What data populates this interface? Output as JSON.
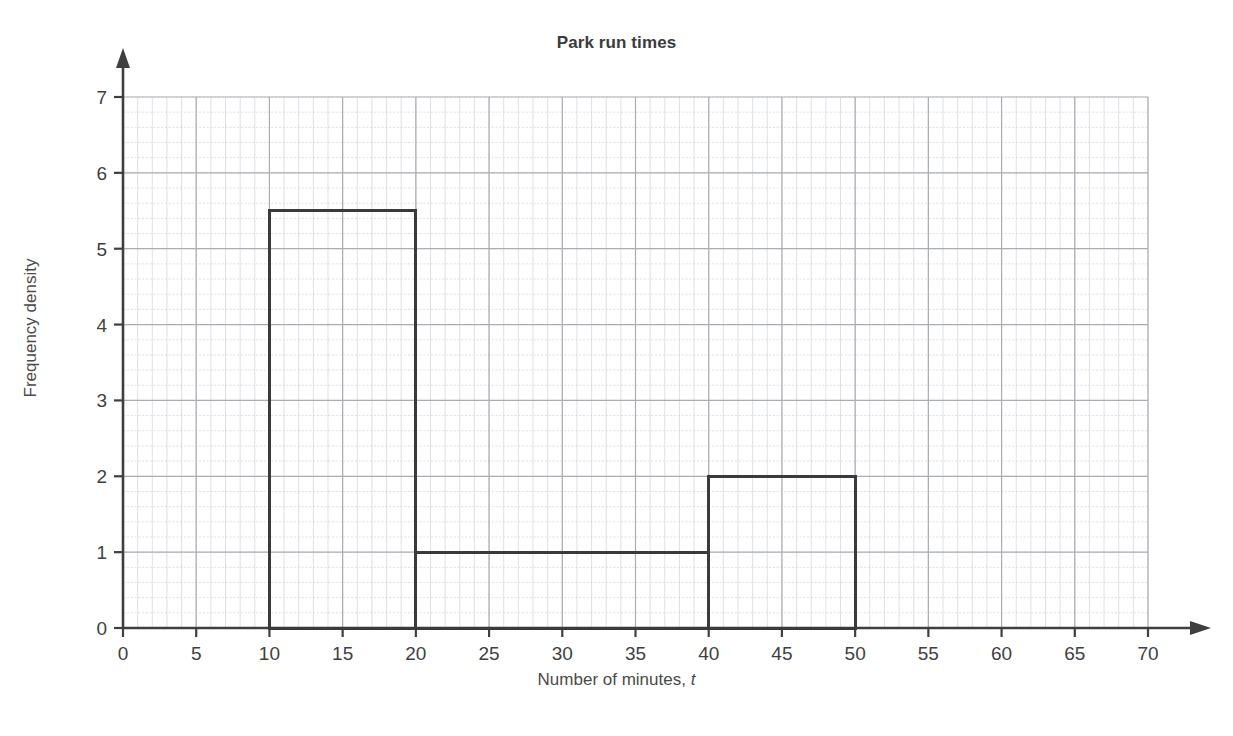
{
  "chart_data": {
    "type": "bar",
    "title": "Park run times",
    "xlabel_prefix": "Number of minutes, ",
    "xlabel_symbol": "t",
    "xlabel": "Number of minutes, t",
    "ylabel": "Frequency density",
    "xlim": [
      0,
      70
    ],
    "ylim": [
      0,
      7
    ],
    "grid": true,
    "grid_style": "graph-paper",
    "x_major_step": 5,
    "y_major_step": 1,
    "x_minor_step": 1,
    "y_minor_step": 0.2,
    "legend": null,
    "xticks": [
      0,
      5,
      10,
      15,
      20,
      25,
      30,
      35,
      40,
      45,
      50,
      55,
      60,
      65,
      70
    ],
    "xtick_labels": [
      "0",
      "5",
      "10",
      "15",
      "20",
      "25",
      "30",
      "35",
      "40",
      "45",
      "50",
      "55",
      "60",
      "65",
      "70"
    ],
    "yticks": [
      0,
      1,
      2,
      3,
      4,
      5,
      6,
      7
    ],
    "ytick_labels": [
      "0",
      "1",
      "2",
      "3",
      "4",
      "5",
      "6",
      "7"
    ],
    "bars": [
      {
        "label": "10 < t ≤ 20",
        "x_start": 10,
        "x_end": 20,
        "height": 5.5,
        "width": 10,
        "frequency": 55
      },
      {
        "label": "20 < t ≤ 40",
        "x_start": 20,
        "x_end": 40,
        "height": 1,
        "width": 20,
        "frequency": 20
      },
      {
        "label": "40 < t ≤ 50",
        "x_start": 40,
        "x_end": 50,
        "height": 2,
        "width": 10,
        "frequency": 20
      }
    ],
    "categories": [
      "10-20",
      "20-40",
      "40-50"
    ],
    "values": [
      5.5,
      1,
      2
    ],
    "colors": {
      "bar_outline": "#3a3a3a",
      "bar_fill": "none",
      "axis": "#3f3f3f",
      "grid_major": "#a9adb4",
      "grid_minor": "#cfd3d8",
      "title": "#3b3b3b",
      "label": "#4a4a4a",
      "background": "#ffffff"
    }
  }
}
